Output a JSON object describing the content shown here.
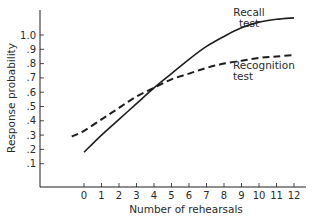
{
  "chart_data": {
    "type": "line",
    "title": "",
    "xlabel": "Number of rehearsals",
    "ylabel": "Response probability",
    "x": [
      0,
      1,
      2,
      3,
      4,
      5,
      6,
      7,
      8,
      9,
      10,
      11,
      12
    ],
    "x_tick_labels": [
      "0",
      "1",
      "2",
      "3",
      "4",
      "5",
      "6",
      "7",
      "8",
      "9",
      "10",
      "11",
      "12"
    ],
    "y_tick_values": [
      0.1,
      0.2,
      0.3,
      0.4,
      0.5,
      0.6,
      0.7,
      0.8,
      0.9,
      1.0
    ],
    "y_tick_labels": [
      ".1",
      ".2",
      ".3",
      ".4",
      ".5",
      ".6",
      ".7",
      ".8",
      ".9",
      "1.0"
    ],
    "ylim": [
      0,
      1.15
    ],
    "xlim": [
      -4.5,
      13.5
    ],
    "grid": false,
    "legend": "inline annotations",
    "series": [
      {
        "name": "Recall test",
        "style": "solid",
        "x": [
          0,
          1,
          2,
          3,
          4,
          5,
          6,
          7,
          8,
          9,
          10,
          11,
          12
        ],
        "values": [
          0.18,
          0.3,
          0.41,
          0.52,
          0.63,
          0.73,
          0.83,
          0.92,
          0.99,
          1.05,
          1.09,
          1.11,
          1.12
        ]
      },
      {
        "name": "Recognition test",
        "style": "dashed",
        "x": [
          -0.7,
          0,
          1,
          2,
          3,
          4,
          5,
          6,
          7,
          8,
          9,
          10,
          11,
          12
        ],
        "values": [
          0.29,
          0.33,
          0.41,
          0.49,
          0.57,
          0.63,
          0.69,
          0.73,
          0.77,
          0.8,
          0.82,
          0.84,
          0.85,
          0.86
        ]
      }
    ],
    "annotations": [
      {
        "lines": [
          "Recall",
          "test"
        ],
        "series": "Recall test"
      },
      {
        "lines": [
          "Recognition",
          "test"
        ],
        "series": "Recognition test"
      }
    ]
  },
  "colors": {
    "ink": "#1e1e1e",
    "background": "#ffffff"
  }
}
